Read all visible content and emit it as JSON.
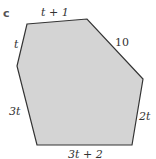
{
  "figure": {
    "part_label": "c",
    "fill_color": "#d4d4d4",
    "stroke_color": "#333333",
    "sides": {
      "top": "t + 1",
      "upper_left": "t",
      "upper_right": "10",
      "lower_left": "3t",
      "right": "2t",
      "bottom": "3t + 2"
    }
  }
}
